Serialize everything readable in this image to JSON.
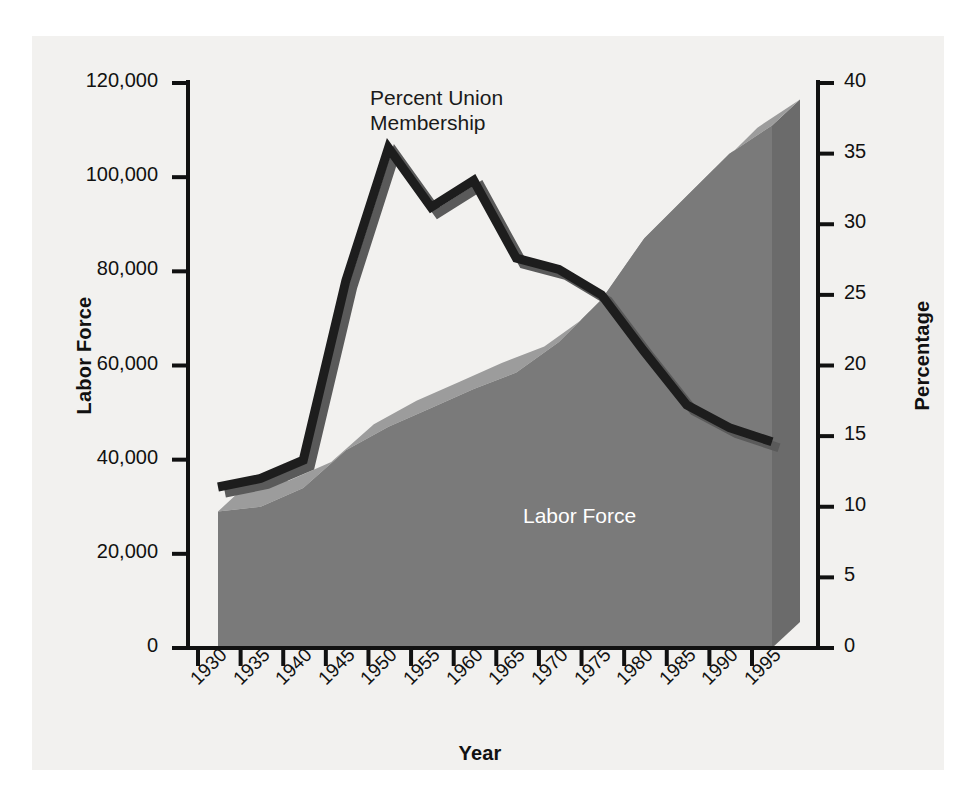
{
  "chart_data": {
    "type": "area",
    "title": "",
    "xlabel": "Year",
    "categories": [
      1930,
      1935,
      1940,
      1945,
      1950,
      1955,
      1960,
      1965,
      1970,
      1975,
      1980,
      1985,
      1990,
      1995
    ],
    "axes": {
      "left": {
        "label": "Labor Force",
        "ticks": [
          "0",
          "20,000",
          "40,000",
          "60,000",
          "80,000",
          "100,000",
          "120,000"
        ],
        "tick_values": [
          0,
          20000,
          40000,
          60000,
          80000,
          100000,
          120000
        ],
        "min": 0,
        "max": 120000
      },
      "right": {
        "label": "Percentage",
        "ticks": [
          "0",
          "5",
          "10",
          "15",
          "20",
          "25",
          "30",
          "35",
          "40"
        ],
        "tick_values": [
          0,
          5,
          10,
          15,
          20,
          25,
          30,
          35,
          40
        ],
        "min": 0,
        "max": 40
      },
      "x": {
        "label": "Year",
        "ticks": [
          "1930",
          "1935",
          "1940",
          "1945",
          "1950",
          "1955",
          "1960",
          "1965",
          "1970",
          "1975",
          "1980",
          "1985",
          "1990",
          "1995"
        ]
      }
    },
    "grid": false,
    "legend_position": "inline-annotations",
    "series": [
      {
        "name": "Labor Force",
        "axis": "left",
        "render": "area-3d",
        "annotation": "Labor Force",
        "color": "#7a7a7a",
        "top_face_color": "#9c9c9c",
        "side_face_color": "#6b6b6b",
        "values": [
          29000,
          30000,
          34000,
          42000,
          47000,
          51000,
          55000,
          58500,
          65000,
          74000,
          87000,
          96000,
          105000,
          111000
        ]
      },
      {
        "name": "Percent Union Membership",
        "axis": "right",
        "render": "line-3d",
        "annotation": "Percent Union\nMembership",
        "color": "#1d1d1d",
        "highlight_color": "#5a5a5a",
        "values": [
          11.4,
          12.0,
          13.3,
          26.0,
          35.4,
          31.2,
          33.1,
          27.6,
          26.8,
          25.0,
          21.0,
          17.2,
          15.6,
          14.6
        ]
      }
    ]
  },
  "annotations": {
    "union_line_1": "Percent Union",
    "union_line_2": "Membership",
    "labor_area": "Labor Force"
  },
  "colors": {
    "plate_background": "#f2f1ef",
    "axis": "#111111",
    "area_front": "#7a7a7a",
    "area_top": "#9c9c9c",
    "area_side": "#6b6b6b",
    "line_dark": "#1d1d1d",
    "line_light": "#5a5a5a",
    "text": "#111111",
    "inverse_text": "#ffffff"
  }
}
